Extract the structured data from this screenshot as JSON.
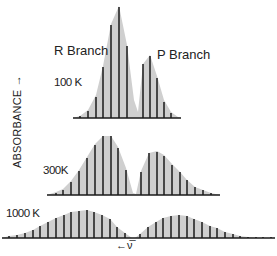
{
  "chart_data": {
    "type": "bar",
    "title": "",
    "ylabel": "ABSORBANCE →",
    "xlabel": "← ν̅",
    "annotations": [
      "R Branch",
      "P Branch"
    ],
    "grid": false,
    "panels": [
      {
        "name": "100K",
        "label": "100 K",
        "baseline_y": 118,
        "axis_x": [
          73,
          181
        ],
        "label_pos": [
          54,
          83
        ],
        "envelope": [
          [
            73,
            118
          ],
          [
            80,
            116
          ],
          [
            88,
            110
          ],
          [
            96,
            95
          ],
          [
            103,
            66
          ],
          [
            111,
            24
          ],
          [
            119,
            6
          ],
          [
            127,
            45
          ],
          [
            134,
            100
          ],
          [
            138,
            112
          ],
          [
            143,
            64
          ],
          [
            150,
            55
          ],
          [
            157,
            76
          ],
          [
            164,
            100
          ],
          [
            171,
            112
          ],
          [
            178,
            117
          ],
          [
            181,
            118
          ]
        ],
        "lines": [
          {
            "x": 80,
            "top": 116
          },
          {
            "x": 88,
            "top": 111
          },
          {
            "x": 96,
            "top": 97
          },
          {
            "x": 103,
            "top": 67
          },
          {
            "x": 111,
            "top": 25
          },
          {
            "x": 119,
            "top": 7
          },
          {
            "x": 127,
            "top": 46
          },
          {
            "x": 143,
            "top": 64
          },
          {
            "x": 150,
            "top": 56
          },
          {
            "x": 157,
            "top": 78
          },
          {
            "x": 164,
            "top": 102
          },
          {
            "x": 171,
            "top": 113
          }
        ]
      },
      {
        "name": "300K",
        "label": "300K",
        "baseline_y": 195,
        "axis_x": [
          47,
          220
        ],
        "label_pos": [
          43,
          163
        ],
        "envelope": [
          [
            47,
            195
          ],
          [
            56,
            192
          ],
          [
            63,
            189
          ],
          [
            71,
            181
          ],
          [
            79,
            170
          ],
          [
            87,
            157
          ],
          [
            95,
            144
          ],
          [
            103,
            136
          ],
          [
            111,
            136
          ],
          [
            118,
            147
          ],
          [
            126,
            168
          ],
          [
            133,
            193
          ],
          [
            136,
            194
          ],
          [
            141,
            171
          ],
          [
            149,
            153
          ],
          [
            157,
            151
          ],
          [
            164,
            155
          ],
          [
            172,
            164
          ],
          [
            180,
            172
          ],
          [
            187,
            180
          ],
          [
            195,
            187
          ],
          [
            203,
            190
          ],
          [
            211,
            193
          ],
          [
            220,
            195
          ]
        ],
        "lines": [
          {
            "x": 56,
            "top": 193
          },
          {
            "x": 63,
            "top": 190
          },
          {
            "x": 71,
            "top": 182
          },
          {
            "x": 79,
            "top": 171
          },
          {
            "x": 87,
            "top": 158
          },
          {
            "x": 95,
            "top": 145
          },
          {
            "x": 103,
            "top": 136
          },
          {
            "x": 111,
            "top": 136
          },
          {
            "x": 118,
            "top": 148
          },
          {
            "x": 126,
            "top": 170
          },
          {
            "x": 141,
            "top": 172
          },
          {
            "x": 149,
            "top": 153
          },
          {
            "x": 157,
            "top": 152
          },
          {
            "x": 164,
            "top": 156
          },
          {
            "x": 172,
            "top": 165
          },
          {
            "x": 180,
            "top": 172
          },
          {
            "x": 187,
            "top": 180
          },
          {
            "x": 195,
            "top": 187
          },
          {
            "x": 203,
            "top": 190
          },
          {
            "x": 211,
            "top": 193
          }
        ]
      },
      {
        "name": "1000K",
        "label": "1000 K",
        "baseline_y": 238,
        "axis_x": [
          2,
          275
        ],
        "label_pos": [
          6,
          207
        ],
        "envelope": [
          [
            2,
            238
          ],
          [
            9,
            236
          ],
          [
            17,
            235
          ],
          [
            25,
            233
          ],
          [
            33,
            230
          ],
          [
            40,
            226
          ],
          [
            48,
            222
          ],
          [
            56,
            218
          ],
          [
            64,
            215
          ],
          [
            71,
            212
          ],
          [
            79,
            211
          ],
          [
            87,
            210
          ],
          [
            94,
            212
          ],
          [
            102,
            215
          ],
          [
            110,
            219
          ],
          [
            117,
            227
          ],
          [
            125,
            233
          ],
          [
            132,
            238
          ],
          [
            135,
            238
          ],
          [
            140,
            234
          ],
          [
            148,
            227
          ],
          [
            156,
            222
          ],
          [
            163,
            218
          ],
          [
            171,
            216
          ],
          [
            179,
            215
          ],
          [
            187,
            216
          ],
          [
            194,
            219
          ],
          [
            202,
            222
          ],
          [
            210,
            226
          ],
          [
            217,
            228
          ],
          [
            225,
            232
          ],
          [
            233,
            234
          ],
          [
            240,
            236
          ],
          [
            248,
            237
          ],
          [
            256,
            238
          ],
          [
            263,
            238
          ],
          [
            271,
            238
          ],
          [
            275,
            238
          ]
        ],
        "lines": [
          {
            "x": 9,
            "top": 236
          },
          {
            "x": 17,
            "top": 235
          },
          {
            "x": 25,
            "top": 233
          },
          {
            "x": 33,
            "top": 230
          },
          {
            "x": 40,
            "top": 226
          },
          {
            "x": 48,
            "top": 222
          },
          {
            "x": 56,
            "top": 218
          },
          {
            "x": 64,
            "top": 215
          },
          {
            "x": 71,
            "top": 212
          },
          {
            "x": 79,
            "top": 211
          },
          {
            "x": 87,
            "top": 210
          },
          {
            "x": 94,
            "top": 212
          },
          {
            "x": 102,
            "top": 215
          },
          {
            "x": 110,
            "top": 219
          },
          {
            "x": 117,
            "top": 227
          },
          {
            "x": 125,
            "top": 233
          },
          {
            "x": 140,
            "top": 234
          },
          {
            "x": 148,
            "top": 227
          },
          {
            "x": 156,
            "top": 222
          },
          {
            "x": 163,
            "top": 218
          },
          {
            "x": 171,
            "top": 216
          },
          {
            "x": 179,
            "top": 215
          },
          {
            "x": 187,
            "top": 216
          },
          {
            "x": 194,
            "top": 219
          },
          {
            "x": 202,
            "top": 222
          },
          {
            "x": 210,
            "top": 226
          },
          {
            "x": 217,
            "top": 228
          },
          {
            "x": 225,
            "top": 232
          },
          {
            "x": 233,
            "top": 234
          },
          {
            "x": 240,
            "top": 236
          },
          {
            "x": 248,
            "top": 237
          },
          {
            "x": 256,
            "top": 237
          },
          {
            "x": 263,
            "top": 237
          },
          {
            "x": 271,
            "top": 237
          }
        ]
      }
    ]
  },
  "labels": {
    "r_branch": "R Branch",
    "p_branch": "P Branch",
    "t100": "100 K",
    "t300": "300K",
    "t1000": "1000 K",
    "ylabel": "ABSORBANCE →",
    "xlabel": "←ν̅"
  },
  "colors": {
    "envelope": "#cfcfcf",
    "line": "#1a1a1a",
    "text": "#222222"
  }
}
